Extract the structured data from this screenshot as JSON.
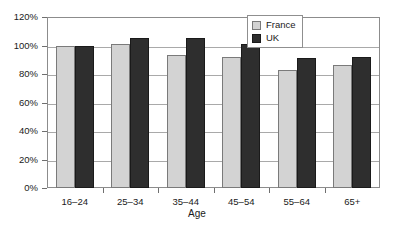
{
  "chart_data": {
    "type": "bar",
    "title": "",
    "xlabel": "Age",
    "ylabel": "",
    "categories": [
      "16–24",
      "25–34",
      "35–44",
      "45–54",
      "55–64",
      "65+"
    ],
    "series": [
      {
        "name": "France",
        "color": "#d3d3d3",
        "values": [
          100,
          101,
          93,
          92,
          83,
          86
        ]
      },
      {
        "name": "UK",
        "color": "#2e2e2e",
        "values": [
          100,
          105,
          105,
          101,
          91,
          92
        ]
      }
    ],
    "ylim": [
      0,
      120
    ],
    "ytick_labels": [
      "0%",
      "20%",
      "40%",
      "60%",
      "80%",
      "100%",
      "120%"
    ],
    "ytick_values": [
      0,
      20,
      40,
      60,
      80,
      100,
      120
    ],
    "grid": "horizontal",
    "legend_position": "top-right-inside",
    "value_suffix": "%"
  },
  "legend": {
    "items": [
      {
        "label": "France"
      },
      {
        "label": "UK"
      }
    ]
  },
  "axes": {
    "x_title": "Age"
  }
}
